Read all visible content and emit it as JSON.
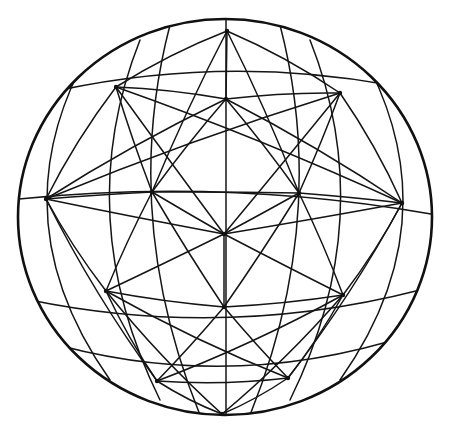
{
  "figure": {
    "stroke_color": "#151515",
    "background": "#ffffff",
    "outline": {
      "cx": 225,
      "cy": 217,
      "rx": 207,
      "ry": 198
    },
    "vertices": {
      "T": [
        227,
        31
      ],
      "UL": [
        116,
        87
      ],
      "UC": [
        226,
        99
      ],
      "UR": [
        340,
        93
      ],
      "ML": [
        46,
        199
      ],
      "CL": [
        152,
        192
      ],
      "CR": [
        299,
        193
      ],
      "MR": [
        402,
        203
      ],
      "C": [
        224,
        234
      ],
      "LL": [
        106,
        291
      ],
      "LR": [
        343,
        295
      ],
      "LC": [
        224,
        307
      ],
      "BL": [
        157,
        381
      ],
      "BR": [
        288,
        378
      ],
      "B": [
        222,
        414
      ]
    },
    "curves": [
      "M19,199 Q225,178 431,214",
      "M30,300 Q225,340 420,290",
      "M60,90 Q225,55 390,85",
      "M40,340 Q225,395 410,335",
      "M226,10 L226,414",
      "M140,40 Q70,217 160,400",
      "M310,40 Q380,217 290,400",
      "M90,50 Q-5,217 110,380",
      "M360,50 Q455,217 340,380",
      "M170,25 Q120,217 200,415",
      "M280,25 Q330,217 250,415"
    ],
    "edges": [
      [
        "T",
        "UL"
      ],
      [
        "T",
        "UC"
      ],
      [
        "T",
        "UR"
      ],
      [
        "UL",
        "UC"
      ],
      [
        "UC",
        "UR"
      ],
      [
        "UL",
        "CL"
      ],
      [
        "UC",
        "CL"
      ],
      [
        "UC",
        "CR"
      ],
      [
        "UR",
        "CR"
      ],
      [
        "UL",
        "ML"
      ],
      [
        "UR",
        "MR"
      ],
      [
        "ML",
        "CL"
      ],
      [
        "CL",
        "CR"
      ],
      [
        "CR",
        "MR"
      ],
      [
        "CL",
        "C"
      ],
      [
        "CR",
        "C"
      ],
      [
        "ML",
        "LL"
      ],
      [
        "CL",
        "LL"
      ],
      [
        "C",
        "LL"
      ],
      [
        "C",
        "LC"
      ],
      [
        "C",
        "LR"
      ],
      [
        "CR",
        "LR"
      ],
      [
        "MR",
        "LR"
      ],
      [
        "LL",
        "LC"
      ],
      [
        "LC",
        "LR"
      ],
      [
        "LL",
        "BL"
      ],
      [
        "LC",
        "BL"
      ],
      [
        "LC",
        "BR"
      ],
      [
        "LR",
        "BR"
      ],
      [
        "BL",
        "BR"
      ],
      [
        "BL",
        "B"
      ],
      [
        "BR",
        "B"
      ],
      [
        "UL",
        "C"
      ],
      [
        "UR",
        "C"
      ],
      [
        "ML",
        "C"
      ],
      [
        "MR",
        "C"
      ],
      [
        "CL",
        "LC"
      ],
      [
        "CR",
        "LC"
      ],
      [
        "T",
        "CL"
      ],
      [
        "T",
        "CR"
      ],
      [
        "ML",
        "BL"
      ],
      [
        "MR",
        "BR"
      ],
      [
        "UL",
        "MR"
      ],
      [
        "UR",
        "ML"
      ],
      [
        "LL",
        "BR"
      ],
      [
        "LR",
        "BL"
      ],
      [
        "ML",
        "UC"
      ],
      [
        "MR",
        "UC"
      ],
      [
        "LL",
        "B"
      ],
      [
        "LR",
        "B"
      ]
    ]
  }
}
